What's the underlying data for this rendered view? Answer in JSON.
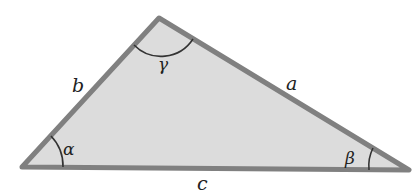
{
  "diagram": {
    "type": "triangle",
    "colors": {
      "fill": "#dcdcdc",
      "edge": "#808080",
      "arc": "#333333",
      "text": "#222222"
    },
    "vertices": {
      "left": [
        22,
        167
      ],
      "top": [
        159,
        18
      ],
      "right": [
        409,
        170
      ]
    },
    "sides": {
      "a": "a",
      "b": "b",
      "c": "c"
    },
    "angles": {
      "alpha": "α",
      "beta": "β",
      "gamma": "γ"
    }
  }
}
